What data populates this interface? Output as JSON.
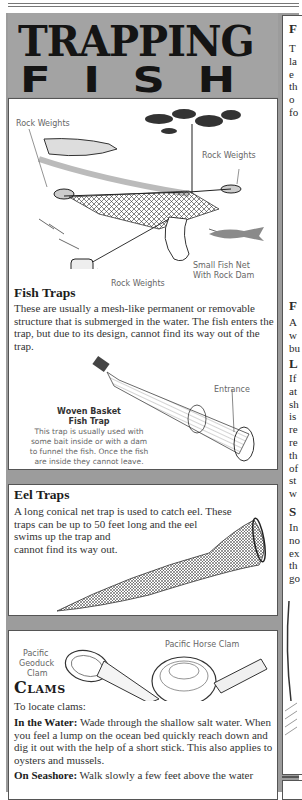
{
  "header": {
    "title_line1": "TRAPPING",
    "title_line2": "FISH"
  },
  "fish_net_section": {
    "labels": {
      "rock_weights_top_left": "Rock Weights",
      "rock_weights_top_right": "Rock Weights",
      "rock_weights_bottom": "Rock Weights",
      "small_fish_net_line1": "Small Fish Net",
      "small_fish_net_line2": "With Rock Dam"
    },
    "heading": "Fish Traps",
    "body": "These are usually a mesh-like permanent or removable structure that is submerged in the water. The fish enters the trap, but due to its design, cannot find its way out of the trap.",
    "basket": {
      "entrance_label": "Entrance",
      "title_line1": "Woven Basket",
      "title_line2": "Fish Trap",
      "caption_lines": [
        "This trap is usually used with",
        "some bait inside or with a dam",
        "to funnel the fish. Once the fish",
        "are inside they cannot leave."
      ]
    }
  },
  "eel_section": {
    "heading": "Eel Traps",
    "body_lines": [
      "A long conical net trap is used to catch eel. These",
      "traps can be up to 50 feet long and the eel",
      "swims up the trap and",
      "cannot find its way out."
    ]
  },
  "clams_section": {
    "labels": {
      "geoduck_line1": "Pacific",
      "geoduck_line2": "Geoduck",
      "geoduck_line3": "Clam",
      "horse_clam": "Pacific Horse Clam"
    },
    "heading": "Clams",
    "intro": "To locate clams:",
    "water_lead": "In the Water:",
    "water_body": " Wade through the shallow salt water. When you feel a lump on the ocean bed quickly reach down and dig it out with the help of a short stick. This also applies to oysters and mussels.",
    "seashore_lead": "On Seashore:",
    "seashore_body": " Walk slowly a few feet above the water"
  },
  "right_column_partial": {
    "heading1": "F",
    "lines1": [
      "T",
      "la",
      "e",
      "th",
      "o",
      "fo"
    ],
    "heading2": "F",
    "lines2": [
      "A",
      "w",
      "bu"
    ],
    "heading3": "L",
    "lines3": [
      "If",
      "at",
      "sh",
      "is",
      "re",
      "re",
      "th",
      "of",
      "st",
      "w"
    ],
    "heading4": "S",
    "lines4": [
      "In",
      "no",
      "ex",
      "th",
      "go"
    ]
  }
}
